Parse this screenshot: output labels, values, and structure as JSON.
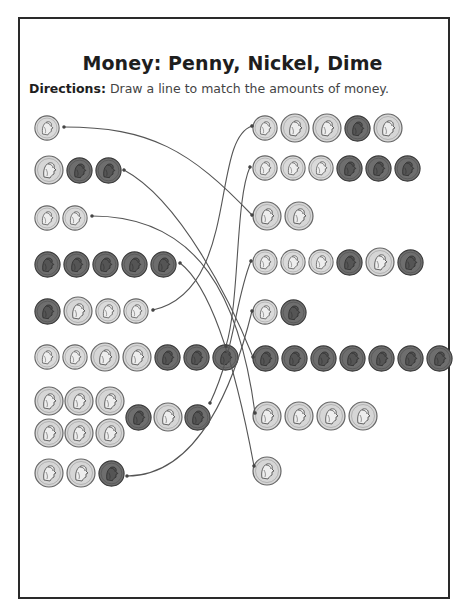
{
  "worksheet": {
    "title": "Money: Penny, Nickel, Dime",
    "directions_label": "Directions:",
    "directions_text": " Draw a line to match the amounts of money."
  },
  "coin_types": {
    "penny": {
      "value_cents": 1,
      "color": "#6e6e6e",
      "diameter": 27
    },
    "nickel": {
      "value_cents": 5,
      "color": "#d6d6d6",
      "diameter": 30
    },
    "dime": {
      "value_cents": 10,
      "color": "#dadada",
      "diameter": 26
    }
  },
  "left_column": [
    {
      "row": 1,
      "coins": [
        "dime"
      ],
      "total_cents": 10
    },
    {
      "row": 2,
      "coins": [
        "nickel",
        "penny",
        "penny"
      ],
      "total_cents": 7
    },
    {
      "row": 3,
      "coins": [
        "dime",
        "dime"
      ],
      "total_cents": 20
    },
    {
      "row": 4,
      "coins": [
        "penny",
        "penny",
        "penny",
        "penny",
        "penny"
      ],
      "total_cents": 5
    },
    {
      "row": 5,
      "coins": [
        "penny",
        "nickel",
        "dime",
        "dime"
      ],
      "total_cents": 26
    },
    {
      "row": 6,
      "coins": [
        "dime",
        "dime",
        "nickel",
        "nickel",
        "penny",
        "penny",
        "penny"
      ],
      "total_cents": 33
    },
    {
      "row": 7,
      "coins": [
        "nickel",
        "nickel",
        "nickel",
        "nickel",
        "nickel",
        "nickel",
        "penny",
        "nickel",
        "penny"
      ],
      "total_cents": 37
    },
    {
      "row": 8,
      "coins": [
        "nickel",
        "nickel",
        "penny"
      ],
      "total_cents": 11
    }
  ],
  "right_column": [
    {
      "row": 1,
      "coins": [
        "dime",
        "nickel",
        "nickel",
        "penny",
        "nickel"
      ],
      "total_cents": 26
    },
    {
      "row": 2,
      "coins": [
        "dime",
        "dime",
        "dime",
        "penny",
        "penny",
        "penny"
      ],
      "total_cents": 33
    },
    {
      "row": 3,
      "coins": [
        "nickel",
        "nickel"
      ],
      "total_cents": 10
    },
    {
      "row": 4,
      "coins": [
        "dime",
        "dime",
        "dime",
        "penny",
        "nickel",
        "penny"
      ],
      "total_cents": 37
    },
    {
      "row": 5,
      "coins": [
        "dime",
        "penny"
      ],
      "total_cents": 11
    },
    {
      "row": 6,
      "coins": [
        "penny",
        "penny",
        "penny",
        "penny",
        "penny",
        "penny",
        "penny"
      ],
      "total_cents": 7
    },
    {
      "row": 7,
      "coins": [
        "nickel",
        "nickel",
        "nickel",
        "nickel"
      ],
      "total_cents": 20
    },
    {
      "row": 8,
      "coins": [
        "nickel"
      ],
      "total_cents": 5
    }
  ],
  "matches": [
    {
      "left_row": 1,
      "right_row": 3
    },
    {
      "left_row": 2,
      "right_row": 6
    },
    {
      "left_row": 3,
      "right_row": 7
    },
    {
      "left_row": 4,
      "right_row": 8
    },
    {
      "left_row": 5,
      "right_row": 1
    },
    {
      "left_row": 6,
      "right_row": 2
    },
    {
      "left_row": 7,
      "right_row": 4
    },
    {
      "left_row": 8,
      "right_row": 5
    }
  ],
  "line_color": "#555555"
}
